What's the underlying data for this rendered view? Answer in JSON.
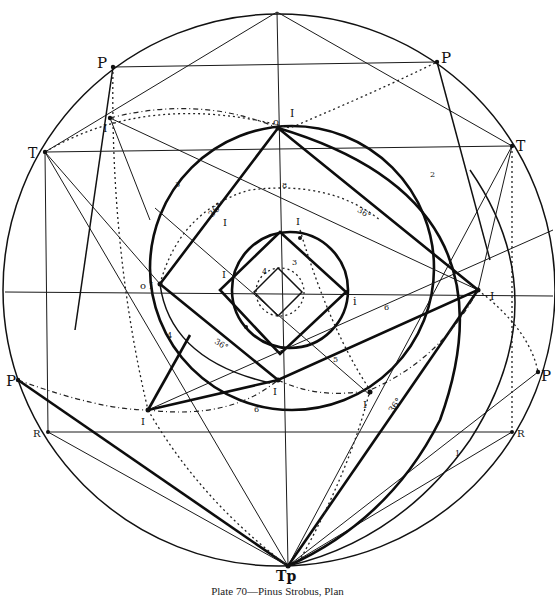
{
  "caption": "Plate 70—Pinus Strobus, Plan",
  "labels": {
    "p_top_left": "P",
    "p_top_right": "P",
    "t_left": "T",
    "t_right": "T",
    "p_left": "P",
    "p_right": "P",
    "r_left": "R",
    "r_right": "R",
    "tp_bottom": "Tp",
    "i_top_left": "I",
    "i_top": "I",
    "o_top": "o",
    "i_left": "o I",
    "i_right": "I",
    "i_inner_right": "i",
    "i_bottom": "I",
    "i_lower_left": "I",
    "i_lower_right": "I",
    "i_inner_left": "I",
    "i_upper_mid": "I",
    "i_upper_right": "I",
    "angle_upper_left": "36°",
    "angle_upper_right": "36°",
    "angle_lower_left": "36°",
    "angle_lower_right": "36°",
    "num_1": "1",
    "num_2": "2",
    "num_3_outer": "3",
    "num_4_outer": "4",
    "num_5_outer": "5",
    "num_3_inner": "3",
    "num_4_inner": "4",
    "num_6_right": "6",
    "num_6_bottom": "6",
    "num_8": "8"
  },
  "colors": {
    "ink": "#111111",
    "paper": "#ffffff"
  }
}
